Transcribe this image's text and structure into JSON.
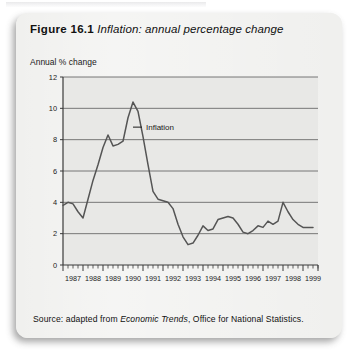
{
  "figure": {
    "number_label": "Figure 16.1",
    "caption": "Inflation: annual percentage change",
    "source_prefix": "Source: adapted from ",
    "source_italic": "Economic Trends",
    "source_suffix": ", Office for National Statistics."
  },
  "colors": {
    "card_background": "#f0f0ee",
    "plot_background": "#e8e8e6",
    "gridline": "#6a6a6a",
    "axis": "#3a3a3a",
    "series": "#555555",
    "text": "#1a1a1a"
  },
  "chart_data": {
    "type": "line",
    "title": "Inflation: annual percentage change",
    "xlabel": "",
    "ylabel": "Annual % change",
    "ylim": [
      0,
      12
    ],
    "yticks": [
      0,
      2,
      4,
      6,
      8,
      10,
      12
    ],
    "ytick_labels": [
      "0",
      "2",
      "4",
      "6",
      "8",
      "10",
      "12"
    ],
    "xlim": [
      1987,
      1999.75
    ],
    "xtick_labels": [
      "1987",
      "1988",
      "1989",
      "1990",
      "1991",
      "1992",
      "1993",
      "1994",
      "1995",
      "1996",
      "1997",
      "1998",
      "1999"
    ],
    "minor_ticks_per_year": 4,
    "grid": true,
    "legend": "none",
    "annotations": [
      {
        "text": "Inflation",
        "x": 1990.5,
        "y": 8.8,
        "leader": true
      }
    ],
    "series": [
      {
        "name": "Inflation",
        "color": "#555555",
        "x": [
          1987.0,
          1987.25,
          1987.5,
          1987.75,
          1988.0,
          1988.25,
          1988.5,
          1988.75,
          1989.0,
          1989.25,
          1989.5,
          1989.75,
          1990.0,
          1990.25,
          1990.5,
          1990.75,
          1991.0,
          1991.25,
          1991.5,
          1991.75,
          1992.0,
          1992.25,
          1992.5,
          1992.75,
          1993.0,
          1993.25,
          1993.5,
          1993.75,
          1994.0,
          1994.25,
          1994.5,
          1994.75,
          1995.0,
          1995.25,
          1995.5,
          1995.75,
          1996.0,
          1996.25,
          1996.5,
          1996.75,
          1997.0,
          1997.25,
          1997.5,
          1997.75,
          1998.0,
          1998.25,
          1998.5,
          1998.75,
          1999.0,
          1999.25,
          1999.5
        ],
        "values": [
          3.8,
          4.0,
          3.9,
          3.4,
          3.0,
          4.2,
          5.4,
          6.4,
          7.5,
          8.3,
          7.6,
          7.7,
          7.9,
          9.4,
          10.4,
          9.8,
          8.2,
          6.4,
          4.7,
          4.2,
          4.1,
          4.0,
          3.6,
          2.6,
          1.8,
          1.3,
          1.4,
          1.9,
          2.5,
          2.2,
          2.3,
          2.9,
          3.0,
          3.1,
          3.0,
          2.6,
          2.1,
          2.0,
          2.2,
          2.5,
          2.4,
          2.8,
          2.6,
          2.8,
          4.0,
          3.4,
          2.9,
          2.6,
          2.4,
          2.4,
          2.4
        ]
      }
    ]
  }
}
